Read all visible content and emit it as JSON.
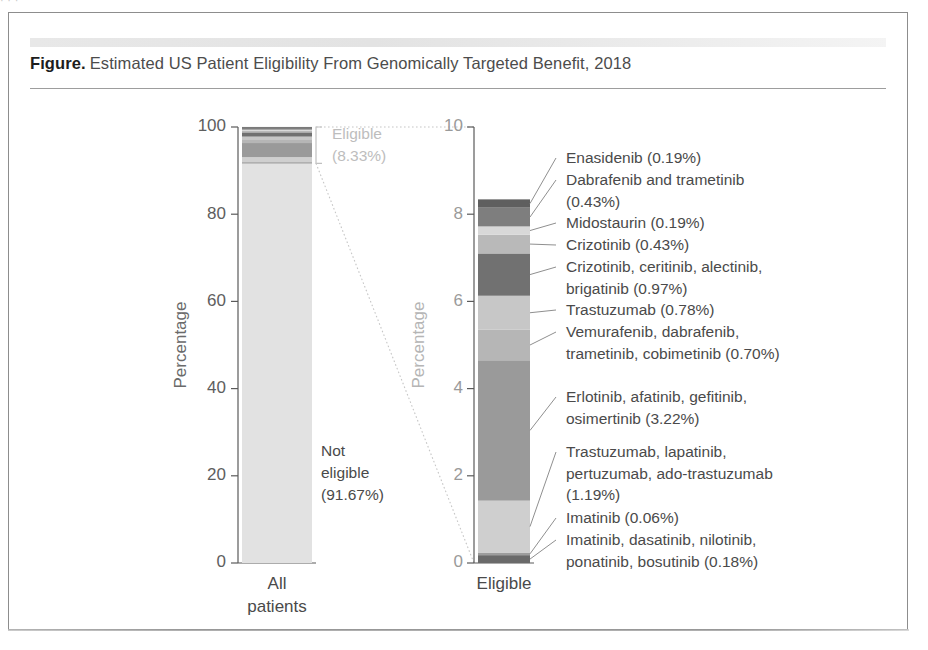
{
  "page": {
    "top_clipped_text": "· · ·"
  },
  "figure": {
    "label": "Figure.",
    "title": "Estimated US Patient Eligibility From Genomically Targeted Benefit, 2018"
  },
  "chart_data": {
    "type": "bar",
    "subtype": "stacked-bar-with-breakout",
    "title": "Estimated US Patient Eligibility From Genomically Targeted Benefit, 2018",
    "grid": false,
    "legend": "none",
    "panels": [
      {
        "name": "all-patients-panel",
        "category": "All patients",
        "category_lines": [
          "All",
          "patients"
        ],
        "ylabel": "Percentage",
        "ylim": [
          0,
          100
        ],
        "yticks": [
          0,
          20,
          40,
          60,
          80,
          100
        ],
        "ytick_labels": [
          "0",
          "20",
          "40",
          "60",
          "80",
          "100"
        ],
        "segments": [
          {
            "label": "Not eligible",
            "value": 91.67,
            "color": "#e2e2e2"
          },
          {
            "label": "Eligible",
            "value": 8.33,
            "color": "#b2b2b2"
          }
        ],
        "annotations": [
          {
            "name": "not-eligible-callout",
            "lines": [
              "Not",
              "eligible",
              "(91.67%)"
            ],
            "value": 91.67
          },
          {
            "name": "eligible-callout",
            "lines": [
              "Eligible",
              "(8.33%)"
            ],
            "value": 8.33,
            "faded": true
          }
        ]
      },
      {
        "name": "eligible-panel",
        "category": "Eligible",
        "category_lines": [
          "Eligible"
        ],
        "ylabel": "Percentage",
        "ylim": [
          0,
          10
        ],
        "yticks": [
          0,
          2,
          4,
          6,
          8,
          10
        ],
        "ytick_labels": [
          "0",
          "2",
          "4",
          "6",
          "8",
          "10"
        ],
        "total": 8.33,
        "segments": [
          {
            "name": "imatinib-dasatinib-nilotinib-ponatinib-bosutinib",
            "lines": [
              "Imatinib, dasatinib, nilotinib,",
              "ponatinib, bosutinib (0.18%)"
            ],
            "value": 0.18,
            "color": "#6a6a6a"
          },
          {
            "name": "imatinib",
            "lines": [
              "Imatinib (0.06%)"
            ],
            "value": 0.06,
            "color": "#9d9d9d"
          },
          {
            "name": "trastuzumab-lapatinib-pertuzumab-ado-trastuzumab",
            "lines": [
              "Trastuzumab, lapatinib,",
              "pertuzumab, ado-trastuzumab",
              "(1.19%)"
            ],
            "value": 1.19,
            "color": "#cfcfcf"
          },
          {
            "name": "erlotinib-afatinib-gefitinib-osimertinib",
            "lines": [
              "Erlotinib, afatinib, gefitinib,",
              "osimertinib (3.22%)"
            ],
            "value": 3.22,
            "color": "#9a9a9a"
          },
          {
            "name": "vemurafenib-dabrafenib-trametinib-cobimetinib",
            "lines": [
              "Vemurafenib, dabrafenib,",
              "trametinib, cobimetinib (0.70%)"
            ],
            "value": 0.7,
            "color": "#b6b6b6"
          },
          {
            "name": "trastuzumab",
            "lines": [
              "Trastuzumab (0.78%)"
            ],
            "value": 0.78,
            "color": "#c7c7c7"
          },
          {
            "name": "crizotinib-ceritinib-alectinib-brigatinib",
            "lines": [
              "Crizotinib, ceritinib, alectinib,",
              "brigatinib (0.97%)"
            ],
            "value": 0.97,
            "color": "#717171"
          },
          {
            "name": "crizotinib",
            "lines": [
              "Crizotinib (0.43%)"
            ],
            "value": 0.43,
            "color": "#b9b9b9"
          },
          {
            "name": "midostaurin",
            "lines": [
              "Midostaurin (0.19%)"
            ],
            "value": 0.19,
            "color": "#d8d8d8"
          },
          {
            "name": "dabrafenib-and-trametinib",
            "lines": [
              "Dabrafenib and trametinib",
              "(0.43%)"
            ],
            "value": 0.43,
            "color": "#7e7e7e"
          },
          {
            "name": "enasidenib",
            "lines": [
              "Enasidenib (0.19%)"
            ],
            "value": 0.19,
            "color": "#5f5f5f"
          }
        ]
      }
    ],
    "callout_labels": [
      {
        "lines": [
          "Enasidenib (0.19%)"
        ]
      },
      {
        "lines": [
          "Dabrafenib and trametinib",
          "(0.43%)"
        ]
      },
      {
        "lines": [
          "Midostaurin (0.19%)"
        ]
      },
      {
        "lines": [
          "Crizotinib (0.43%)"
        ]
      },
      {
        "lines": [
          "Crizotinib, ceritinib, alectinib,",
          "brigatinib (0.97%)"
        ]
      },
      {
        "lines": [
          "Trastuzumab (0.78%)"
        ]
      },
      {
        "lines": [
          "Vemurafenib, dabrafenib,",
          "trametinib, cobimetinib (0.70%)"
        ]
      },
      {
        "lines": [
          "Erlotinib, afatinib, gefitinib,",
          "osimertinib (3.22%)"
        ]
      },
      {
        "lines": [
          "Trastuzumab, lapatinib,",
          "pertuzumab, ado-trastuzumab",
          "(1.19%)"
        ]
      },
      {
        "lines": [
          "Imatinib (0.06%)"
        ]
      },
      {
        "lines": [
          "Imatinib, dasatinib, nilotinib,",
          "ponatinib, bosutinib (0.18%)"
        ]
      }
    ]
  }
}
